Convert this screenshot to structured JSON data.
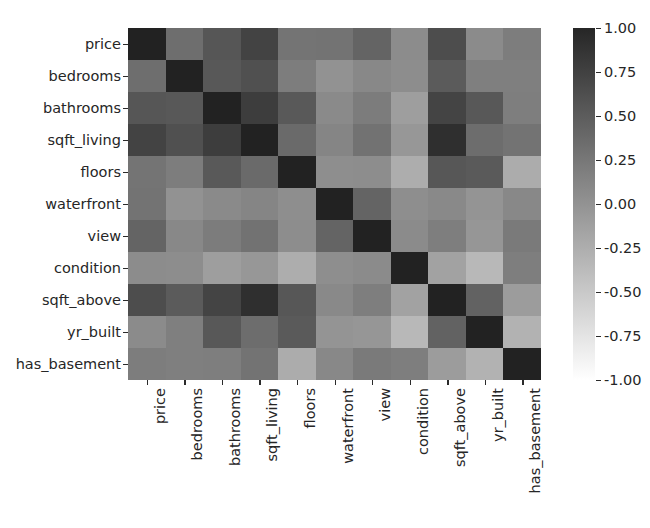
{
  "figure": {
    "title": "",
    "background_color": "#ffffff",
    "text_color": "#262626"
  },
  "chart_data": {
    "type": "heatmap",
    "title": "",
    "xlabel": "",
    "ylabel": "",
    "colormap": "gray",
    "grid": false,
    "legend_position": "right",
    "categories": [
      "price",
      "bedrooms",
      "bathrooms",
      "sqft_living",
      "floors",
      "waterfront",
      "view",
      "condition",
      "sqft_above",
      "yr_built",
      "has_basement"
    ],
    "x_tick_labels": [
      "price",
      "bedrooms",
      "bathrooms",
      "sqft_living",
      "floors",
      "waterfront",
      "view",
      "condition",
      "sqft_above",
      "yr_built",
      "has_basement"
    ],
    "y_tick_labels": [
      "price",
      "bedrooms",
      "bathrooms",
      "sqft_living",
      "floors",
      "waterfront",
      "view",
      "condition",
      "sqft_above",
      "yr_built",
      "has_basement"
    ],
    "zlim": [
      -1.0,
      1.0
    ],
    "colorbar_ticks": [
      1.0,
      0.75,
      0.5,
      0.25,
      0.0,
      -0.25,
      -0.5,
      -0.75,
      -1.0
    ],
    "colorbar_tick_labels": [
      "1.00",
      "0.75",
      "0.50",
      "0.25",
      "0.00",
      "-0.25",
      "-0.50",
      "-0.75",
      "-1.00"
    ],
    "values": [
      [
        1.0,
        0.31,
        0.53,
        0.7,
        0.26,
        0.27,
        0.4,
        0.04,
        0.61,
        0.05,
        0.18
      ],
      [
        0.31,
        1.0,
        0.51,
        0.58,
        0.18,
        -0.01,
        0.08,
        0.03,
        0.48,
        0.16,
        0.16
      ],
      [
        0.53,
        0.51,
        1.0,
        0.76,
        0.5,
        0.06,
        0.19,
        -0.12,
        0.69,
        0.51,
        0.17
      ],
      [
        0.7,
        0.58,
        0.76,
        1.0,
        0.35,
        0.1,
        0.28,
        -0.06,
        0.88,
        0.32,
        0.27
      ],
      [
        0.26,
        0.18,
        0.5,
        0.35,
        1.0,
        0.02,
        0.03,
        -0.26,
        0.52,
        0.49,
        -0.25
      ],
      [
        0.27,
        -0.01,
        0.06,
        0.1,
        0.02,
        1.0,
        0.4,
        0.02,
        0.07,
        -0.03,
        0.08
      ],
      [
        0.4,
        0.08,
        0.19,
        0.28,
        0.03,
        0.4,
        1.0,
        0.05,
        0.17,
        -0.05,
        0.2
      ],
      [
        0.04,
        0.03,
        -0.12,
        -0.06,
        -0.26,
        0.02,
        0.05,
        1.0,
        -0.16,
        -0.36,
        0.17
      ],
      [
        0.61,
        0.48,
        0.69,
        0.88,
        0.52,
        0.07,
        0.17,
        -0.16,
        1.0,
        0.42,
        -0.1
      ],
      [
        0.05,
        0.16,
        0.51,
        0.32,
        0.49,
        -0.03,
        -0.05,
        -0.36,
        0.42,
        1.0,
        -0.3
      ],
      [
        0.18,
        0.16,
        0.17,
        0.27,
        -0.25,
        0.08,
        0.2,
        0.17,
        -0.1,
        -0.3,
        1.0
      ]
    ]
  }
}
